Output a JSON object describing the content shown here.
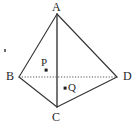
{
  "figure": {
    "name": "tetrahedron-abcd-diagram",
    "background_color": "#ffffff",
    "stroke_color": "#333333",
    "hidden_edge_color": "#555555",
    "label_color": "#262626",
    "width": 138,
    "height": 127,
    "vertices": [
      {
        "id": "A",
        "label": "A",
        "x": 57,
        "y": 14
      },
      {
        "id": "B",
        "label": "B",
        "x": 19,
        "y": 77
      },
      {
        "id": "C",
        "label": "C",
        "x": 57,
        "y": 107
      },
      {
        "id": "D",
        "label": "D",
        "x": 117,
        "y": 77
      }
    ],
    "interior_points": [
      {
        "id": "P",
        "label": "P",
        "x": 46,
        "y": 70,
        "dot_size": 3
      },
      {
        "id": "Q",
        "label": "Q",
        "x": 65,
        "y": 88,
        "dot_size": 3
      }
    ],
    "edges": [
      {
        "id": "AB",
        "from": "A",
        "to": "B",
        "style": "solid"
      },
      {
        "id": "AC",
        "from": "A",
        "to": "C",
        "style": "solid"
      },
      {
        "id": "AD",
        "from": "A",
        "to": "D",
        "style": "solid"
      },
      {
        "id": "BC",
        "from": "B",
        "to": "C",
        "style": "solid"
      },
      {
        "id": "CD",
        "from": "C",
        "to": "D",
        "style": "solid"
      },
      {
        "id": "BD",
        "from": "B",
        "to": "D",
        "style": "dotted"
      }
    ],
    "stray_mark": {
      "x": 4,
      "y": 49,
      "width": 2,
      "height": 3
    }
  }
}
